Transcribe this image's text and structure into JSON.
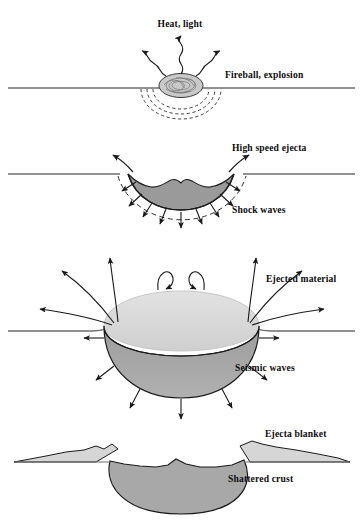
{
  "figure": {
    "type": "cross-section-diagram",
    "panel_count": 4,
    "background_color": "#ffffff",
    "line_color": "#1a1a1a",
    "ground_line_color": "#6e6e6e"
  },
  "colors": {
    "fireball_fill": "#c9c9c9",
    "crater_fill_mid": "#9a9a9a",
    "dome_light": "#d8d8d8",
    "bowl_mid": "#a3a3a3",
    "ejecta_blanket_fill": "#d6d6d6",
    "shattered_crust_fill": "#a8a8a8",
    "stroke": "#1a1a1a"
  },
  "panels": [
    {
      "id": "panel-1",
      "stage": "Fireball and explosion",
      "ground_y": 88,
      "labels": [
        {
          "id": "heat-light",
          "text": "Heat, light",
          "x": 180,
          "y": 27,
          "anchor": "middle"
        },
        {
          "id": "fireball-explosion",
          "text": "Fireball, explosion",
          "x": 225,
          "y": 78,
          "anchor": "start"
        }
      ],
      "features": [
        {
          "name": "fireball",
          "shape": "scribbled-ellipse",
          "cx": 181,
          "cy": 86,
          "rx": 22,
          "ry": 12
        },
        {
          "name": "shock-arcs",
          "style": "dashed",
          "count": 3
        },
        {
          "name": "radiation-arrows",
          "style": "wavy",
          "count": 3,
          "directions": [
            "up-left",
            "up",
            "up-right"
          ]
        }
      ]
    },
    {
      "id": "panel-2",
      "stage": "Excavation, high speed ejecta",
      "ground_y": 174,
      "labels": [
        {
          "id": "high-speed-ejecta",
          "text": "High speed ejecta",
          "x": 232,
          "y": 151,
          "anchor": "start"
        },
        {
          "id": "shock-waves",
          "text": "Shock waves",
          "x": 232,
          "y": 213,
          "anchor": "start"
        }
      ],
      "features": [
        {
          "name": "transient-crater",
          "shape": "bowl",
          "width": 120,
          "depth": 30
        },
        {
          "name": "shock-front",
          "style": "dashed-arc"
        },
        {
          "name": "ejecta-arrows",
          "count": 2,
          "directions": [
            "up-left",
            "up-right"
          ]
        },
        {
          "name": "shock-wave-arrows",
          "count": 9,
          "direction": "radial-outward"
        }
      ]
    },
    {
      "id": "panel-3",
      "stage": "Ejected material and seismic waves",
      "ground_y": 328,
      "labels": [
        {
          "id": "ejected-material",
          "text": "Ejected material",
          "x": 266,
          "y": 282,
          "anchor": "start"
        },
        {
          "id": "seismic-waves",
          "text": "Seismic waves",
          "x": 235,
          "y": 371,
          "anchor": "start"
        }
      ],
      "features": [
        {
          "name": "excavation-dome",
          "shape": "hemisphere",
          "cx": 181,
          "cy": 328,
          "rx": 78,
          "ry": 34
        },
        {
          "name": "excavation-bowl",
          "shape": "lower-hemisphere",
          "depth": 52
        },
        {
          "name": "ballistic-trajectory-arcs",
          "count": 6
        },
        {
          "name": "recirculation-arrows",
          "count": 2
        },
        {
          "name": "seismic-arrows",
          "count": 7,
          "direction": "radial-outward"
        }
      ]
    },
    {
      "id": "panel-4",
      "stage": "Final crater with ejecta blanket",
      "ground_y": 462,
      "labels": [
        {
          "id": "ejecta-blanket",
          "text": "Ejecta blanket",
          "x": 265,
          "y": 437,
          "anchor": "start"
        },
        {
          "id": "shattered-crust",
          "text": "Shattered crust",
          "x": 228,
          "y": 482,
          "anchor": "start"
        }
      ],
      "features": [
        {
          "name": "ejecta-blanket-left",
          "shape": "tapered-wedge"
        },
        {
          "name": "ejecta-blanket-right",
          "shape": "tapered-wedge"
        },
        {
          "name": "crater-floor",
          "shape": "irregular-bowl",
          "width": 140,
          "depth": 62
        },
        {
          "name": "breccia-lens",
          "fill": "shattered_crust_fill"
        }
      ]
    }
  ]
}
